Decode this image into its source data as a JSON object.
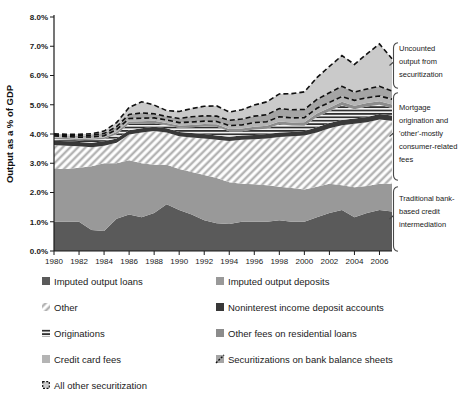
{
  "chart_data": {
    "type": "area",
    "stacked": true,
    "title": "",
    "xlabel": "",
    "ylabel": "Output as a % of GDP",
    "ylim": [
      0,
      8
    ],
    "ytick_labels": [
      "0.0%",
      "1.0%",
      "2.0%",
      "3.0%",
      "4.0%",
      "5.0%",
      "6.0%",
      "7.0%",
      "8.0%"
    ],
    "x": [
      1980,
      1981,
      1982,
      1983,
      1984,
      1985,
      1986,
      1987,
      1988,
      1989,
      1990,
      1991,
      1992,
      1993,
      1994,
      1995,
      1996,
      1997,
      1998,
      1999,
      2000,
      2001,
      2002,
      2003,
      2004,
      2005,
      2006,
      2007
    ],
    "xtick_labels": [
      "1980",
      "1982",
      "1984",
      "1986",
      "1988",
      "1990",
      "1992",
      "1994",
      "1996",
      "1998",
      "2000",
      "2002",
      "2004",
      "2006"
    ],
    "grid": false,
    "legend_position": "below",
    "series": [
      {
        "name": "Imputed output loans",
        "key": "loans",
        "style": "solid",
        "color": "#5a5a5a",
        "values": [
          1.0,
          1.0,
          1.0,
          0.72,
          0.68,
          1.1,
          1.25,
          1.15,
          1.3,
          1.6,
          1.4,
          1.25,
          1.05,
          0.95,
          0.92,
          1.0,
          1.0,
          1.0,
          1.05,
          1.0,
          1.0,
          1.15,
          1.3,
          1.4,
          1.15,
          1.3,
          1.4,
          1.35
        ]
      },
      {
        "name": "Imputed output deposits",
        "key": "deposits",
        "style": "solid",
        "color": "#999999",
        "values": [
          1.8,
          1.8,
          1.85,
          2.18,
          2.32,
          1.9,
          1.85,
          1.85,
          1.65,
          1.35,
          1.4,
          1.45,
          1.55,
          1.55,
          1.43,
          1.3,
          1.28,
          1.25,
          1.15,
          1.15,
          1.1,
          1.05,
          1.0,
          0.85,
          1.03,
          0.92,
          0.9,
          0.95
        ]
      },
      {
        "name": "Other",
        "key": "other",
        "style": "hatch",
        "color": "#b3b3b3",
        "values": [
          0.82,
          0.8,
          0.73,
          0.65,
          0.6,
          0.7,
          0.88,
          1.05,
          1.15,
          1.1,
          1.12,
          1.18,
          1.25,
          1.3,
          1.41,
          1.5,
          1.54,
          1.6,
          1.7,
          1.77,
          1.85,
          1.85,
          1.9,
          2.05,
          2.17,
          2.18,
          2.2,
          2.15
        ]
      },
      {
        "name": "Noninterest income deposit accounts",
        "key": "noninterest",
        "style": "solid",
        "color": "#383838",
        "values": [
          0.15,
          0.15,
          0.15,
          0.15,
          0.15,
          0.15,
          0.15,
          0.15,
          0.15,
          0.15,
          0.15,
          0.15,
          0.15,
          0.15,
          0.15,
          0.15,
          0.15,
          0.15,
          0.15,
          0.15,
          0.15,
          0.18,
          0.18,
          0.18,
          0.18,
          0.18,
          0.18,
          0.18
        ]
      },
      {
        "name": "Originations",
        "key": "originations",
        "style": "hstripe",
        "color": "#151515",
        "values": [
          0.06,
          0.06,
          0.06,
          0.1,
          0.08,
          0.14,
          0.22,
          0.16,
          0.12,
          0.1,
          0.14,
          0.2,
          0.26,
          0.3,
          0.18,
          0.14,
          0.18,
          0.18,
          0.28,
          0.22,
          0.18,
          0.35,
          0.4,
          0.5,
          0.32,
          0.36,
          0.32,
          0.26
        ]
      },
      {
        "name": "Other fees on residential loans",
        "key": "resloans",
        "style": "solid",
        "color": "#8c8c8c",
        "values": [
          0.05,
          0.05,
          0.05,
          0.05,
          0.05,
          0.08,
          0.08,
          0.08,
          0.08,
          0.08,
          0.08,
          0.08,
          0.08,
          0.08,
          0.08,
          0.1,
          0.1,
          0.1,
          0.1,
          0.1,
          0.12,
          0.12,
          0.12,
          0.12,
          0.12,
          0.12,
          0.12,
          0.12
        ]
      },
      {
        "name": "Credit card fees",
        "key": "creditcard",
        "style": "solid",
        "color": "#b4b4b4",
        "values": [
          0.05,
          0.05,
          0.05,
          0.05,
          0.06,
          0.08,
          0.1,
          0.1,
          0.1,
          0.1,
          0.1,
          0.1,
          0.1,
          0.1,
          0.12,
          0.12,
          0.14,
          0.14,
          0.16,
          0.16,
          0.16,
          0.18,
          0.18,
          0.18,
          0.18,
          0.18,
          0.18,
          0.18
        ]
      },
      {
        "name": "Securitizations on bank balance sheets",
        "key": "sec_bank",
        "style": "dashed_fill",
        "color": "#a5a5a5",
        "values": [
          0.04,
          0.04,
          0.05,
          0.06,
          0.08,
          0.1,
          0.14,
          0.18,
          0.14,
          0.12,
          0.14,
          0.18,
          0.18,
          0.18,
          0.18,
          0.2,
          0.22,
          0.24,
          0.28,
          0.28,
          0.28,
          0.3,
          0.33,
          0.35,
          0.28,
          0.3,
          0.33,
          0.28
        ]
      },
      {
        "name": "All other securitization",
        "key": "all_other_sec",
        "style": "dashed_fill",
        "color": "#cacaca",
        "values": [
          0.04,
          0.04,
          0.05,
          0.05,
          0.08,
          0.14,
          0.24,
          0.38,
          0.3,
          0.2,
          0.24,
          0.28,
          0.33,
          0.35,
          0.28,
          0.32,
          0.38,
          0.44,
          0.5,
          0.55,
          0.6,
          0.75,
          0.9,
          1.05,
          0.95,
          1.2,
          1.45,
          1.1
        ]
      }
    ],
    "annotations": [
      {
        "text": "Uncounted output from securitization"
      },
      {
        "text": "Mortgage origination and 'other'-mostly consumer-related fees"
      },
      {
        "text": "Traditional bank-based credit intermediation"
      }
    ]
  },
  "legend": {
    "items": [
      {
        "label": "Imputed output loans",
        "swatch": "loans"
      },
      {
        "label": "Imputed output deposits",
        "swatch": "deposits"
      },
      {
        "label": "Other",
        "swatch": "other"
      },
      {
        "label": "Noninterest income deposit accounts",
        "swatch": "noninterest"
      },
      {
        "label": "Originations",
        "swatch": "originations"
      },
      {
        "label": "Other fees on residential loans",
        "swatch": "resloans"
      },
      {
        "label": "Credit card fees",
        "swatch": "creditcard"
      },
      {
        "label": "Securitizations on bank balance sheets",
        "swatch": "sec_bank"
      },
      {
        "label": "All other securitization",
        "swatch": "all_other_sec"
      }
    ]
  },
  "colors": {
    "axis": "#1a1a1a",
    "dash_line": "#101010",
    "bracket": "#4a4a4a"
  }
}
